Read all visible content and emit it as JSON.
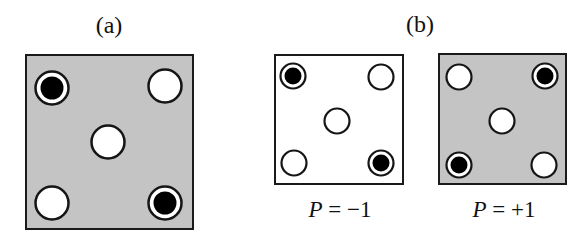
{
  "panels": [
    {
      "id": "a",
      "label": "(a)",
      "caption": "",
      "background": "gray",
      "background_color": "#c4c4c4",
      "circles": [
        {
          "position": "top-left",
          "state": "filled"
        },
        {
          "position": "top-right",
          "state": "open"
        },
        {
          "position": "center",
          "state": "open"
        },
        {
          "position": "bottom-left",
          "state": "open"
        },
        {
          "position": "bottom-right",
          "state": "filled"
        }
      ]
    },
    {
      "id": "b-left",
      "label": "(b)",
      "caption": "P = −1",
      "caption_var": "P",
      "caption_rest": " = −1",
      "background": "white",
      "background_color": "#ffffff",
      "circles": [
        {
          "position": "top-left",
          "state": "filled"
        },
        {
          "position": "top-right",
          "state": "open"
        },
        {
          "position": "center",
          "state": "open"
        },
        {
          "position": "bottom-left",
          "state": "open"
        },
        {
          "position": "bottom-right",
          "state": "filled"
        }
      ]
    },
    {
      "id": "b-right",
      "label": "",
      "caption": "P = +1",
      "caption_var": "P",
      "caption_rest": " = +1",
      "background": "gray",
      "background_color": "#c4c4c4",
      "circles": [
        {
          "position": "top-left",
          "state": "open"
        },
        {
          "position": "top-right",
          "state": "filled"
        },
        {
          "position": "center",
          "state": "open"
        },
        {
          "position": "bottom-left",
          "state": "filled"
        },
        {
          "position": "bottom-right",
          "state": "open"
        }
      ]
    }
  ],
  "labels": {
    "a": "(a)",
    "b": "(b)"
  },
  "captions": {
    "b_left": {
      "var": "P",
      "rest": " = −1"
    },
    "b_right": {
      "var": "P",
      "rest": " = +1"
    }
  }
}
